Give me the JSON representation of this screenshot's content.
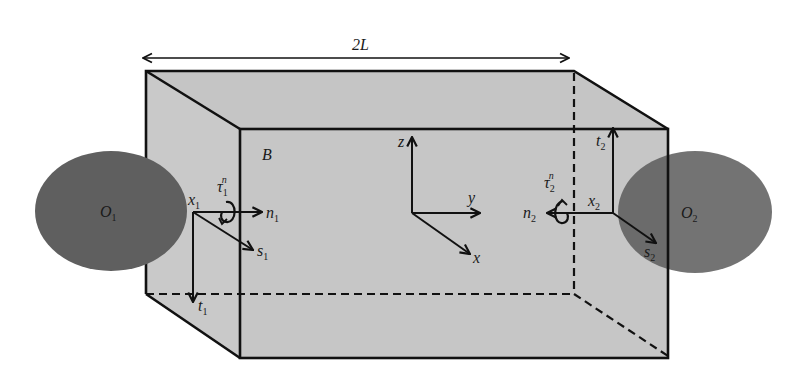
{
  "figure": {
    "type": "3d-box-with-contact-frames",
    "colors": {
      "box_fill": "#c8c8c8",
      "edge": "#111111",
      "contact_body": "#5f5f5f",
      "background": "#ffffff"
    }
  },
  "dimension": {
    "label": "2L"
  },
  "body": {
    "label": "B"
  },
  "world_frame": {
    "axes": {
      "z": "z",
      "y": "y",
      "x": "x"
    }
  },
  "contact_1": {
    "object_label": "O",
    "object_sub": "1",
    "point_label": "x",
    "point_sub": "1",
    "torque_label": "τ",
    "torque_sub": "1",
    "torque_sup": "n",
    "normal_label": "n",
    "normal_sub": "1",
    "tangent_s_label": "s",
    "tangent_s_sub": "1",
    "tangent_t_label": "t",
    "tangent_t_sub": "1"
  },
  "contact_2": {
    "object_label": "O",
    "object_sub": "2",
    "point_label": "x",
    "point_sub": "2",
    "torque_label": "τ",
    "torque_sub": "2",
    "torque_sup": "n",
    "normal_label": "n",
    "normal_sub": "2",
    "tangent_s_label": "s",
    "tangent_s_sub": "2",
    "tangent_t_label": "t",
    "tangent_t_sub": "2"
  }
}
